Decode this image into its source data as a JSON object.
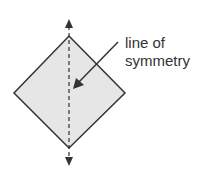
{
  "diagram": {
    "shape": "square rotated 45 degrees (diamond)",
    "fill_color": "#e6e6e6",
    "stroke_color": "#333333",
    "label": {
      "line1": "line of",
      "line2": "symmetry"
    }
  }
}
